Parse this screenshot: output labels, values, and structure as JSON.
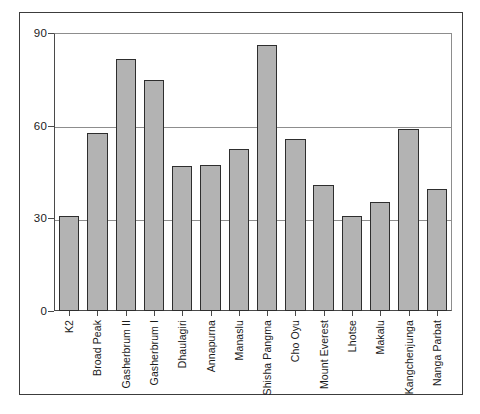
{
  "chart_data": {
    "type": "bar",
    "title": "",
    "subtitle": "",
    "xlabel": "",
    "ylabel": "",
    "categories": [
      "K2",
      "Broad Peak",
      "Gasherbrum II",
      "Gasherbrum I",
      "Dhaulagiri",
      "Annapurna",
      "Manaslu",
      "Shisha Pangma",
      "Cho Oyu",
      "Mount Everest",
      "Lhotse",
      "Makalu",
      "Kangchenjunga",
      "Nanga Parbat"
    ],
    "values": [
      31,
      58,
      82,
      75,
      47,
      47.5,
      52.5,
      86.5,
      56,
      41,
      31,
      35.5,
      59,
      39.5
    ],
    "ylim": [
      0,
      90
    ],
    "yticks": [
      0,
      30,
      60,
      90
    ],
    "ytick_labels": [
      "0",
      "30",
      "60",
      "90"
    ],
    "grid": true,
    "gridlines_at": [
      30,
      60,
      90
    ],
    "legend": "none",
    "bar_color": "#b3b3b3",
    "bar_edge_color": "#2e2e2e",
    "axis_color": "#4a4a4a",
    "grid_color": "#8d8d8d",
    "frame_color": "#3c3c3c",
    "background": "#ffffff"
  }
}
